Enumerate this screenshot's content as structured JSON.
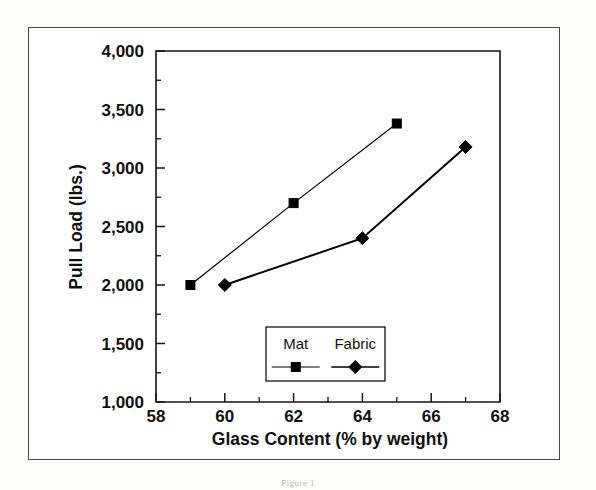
{
  "figure": {
    "caption": "Figure 1"
  },
  "chart_data": {
    "type": "line",
    "title": "",
    "xlabel": "Glass Content (% by weight)",
    "ylabel": "Pull Load (lbs.)",
    "xlim": [
      58,
      68
    ],
    "ylim": [
      1000,
      4000
    ],
    "xticks": [
      58,
      60,
      62,
      64,
      66,
      68
    ],
    "xtick_labels": [
      "58",
      "60",
      "62",
      "64",
      "66",
      "68"
    ],
    "x_minor_ticks": [
      59,
      61,
      63,
      65,
      67
    ],
    "yticks": [
      1000,
      1500,
      2000,
      2500,
      3000,
      3500,
      4000
    ],
    "ytick_labels": [
      "1,000",
      "1,500",
      "2,000",
      "2,500",
      "3,000",
      "3,500",
      "4,000"
    ],
    "y_minor_ticks": [
      1250,
      1750,
      2250,
      2750,
      3250,
      3750
    ],
    "grid": false,
    "legend_position": "inside-bottom-center",
    "series": [
      {
        "name": "Mat",
        "marker": "square",
        "color": "#000000",
        "x": [
          59,
          62,
          65
        ],
        "values": [
          2000,
          2700,
          3380
        ]
      },
      {
        "name": "Fabric",
        "marker": "diamond",
        "color": "#000000",
        "x": [
          60,
          64,
          67
        ],
        "values": [
          2000,
          2400,
          3180
        ]
      }
    ]
  }
}
